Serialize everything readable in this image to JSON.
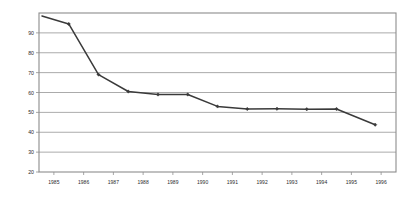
{
  "chart_data": {
    "type": "line",
    "title": "",
    "subtitle": "",
    "xlabel": "",
    "ylabel": "",
    "grid": "horizontal",
    "legend": "none",
    "xlim": [
      1984.5,
      1996.5
    ],
    "ylim": [
      20,
      100
    ],
    "y_ticks": [
      90,
      80,
      70,
      60,
      50,
      40,
      30,
      20
    ],
    "x_ticks": [
      1985,
      1986,
      1987,
      1988,
      1989,
      1990,
      1991,
      1992,
      1993,
      1994,
      1995,
      1996
    ],
    "x_tick_labels": [
      "1985",
      "1986",
      "1987",
      "1988",
      "1989",
      "1990",
      "1991",
      "1992",
      "1993",
      "1994",
      "1995",
      "1996"
    ],
    "series": [
      {
        "name": "series-1",
        "color": "#3a3a3a",
        "marker": "diamond",
        "x": [
          1984.6,
          1985.5,
          1986.5,
          1987.5,
          1988.5,
          1989.5,
          1990.5,
          1991.5,
          1992.5,
          1993.5,
          1994.5,
          1995.8
        ],
        "y": [
          98.5,
          94.5,
          69,
          60.5,
          59,
          59,
          53,
          51.7,
          51.8,
          51.6,
          51.7,
          43.8
        ]
      }
    ]
  },
  "axis": {
    "y_labels": [
      "90",
      "80",
      "70",
      "60",
      "50",
      "40",
      "30",
      "20"
    ],
    "x_labels": [
      "1985",
      "1986",
      "1987",
      "1988",
      "1989",
      "1990",
      "1991",
      "1992",
      "1993",
      "1994",
      "1995",
      "1996"
    ]
  },
  "colors": {
    "line": "#3a3a3a",
    "grid": "#8f8f8f",
    "frame": "#8c8c8c",
    "background": "#ffffff",
    "text": "#2b2b2b"
  }
}
